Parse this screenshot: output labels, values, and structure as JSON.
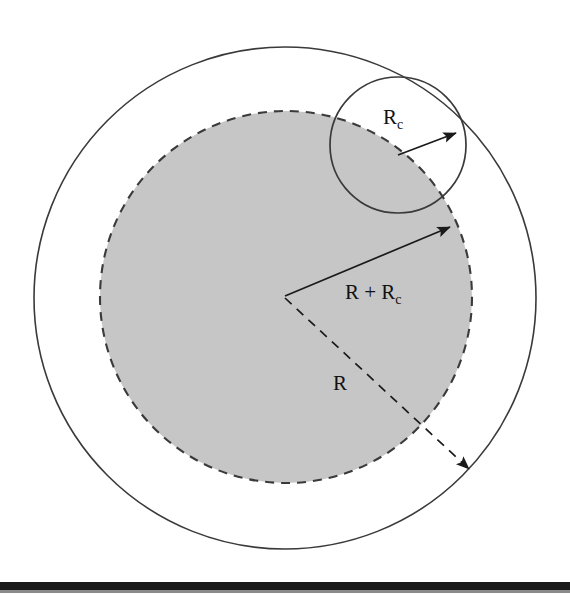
{
  "figure": {
    "background_color": "#ffffff",
    "stroke_color": "#3a3a3a",
    "shade_color": "#c6c6c6",
    "label_color": "#111111",
    "baseline_bar_color": "#1a1a1a"
  },
  "labels": {
    "small_radius": {
      "base": "R",
      "sub": "c"
    },
    "sum_radius": {
      "base": "R + R",
      "sub": "c"
    },
    "big_radius": {
      "base": "R",
      "sub": ""
    }
  },
  "geometry": {
    "center": {
      "x": 285,
      "y": 298
    },
    "outer_circle": {
      "cx": 285,
      "cy": 298,
      "r": 251,
      "style": "solid",
      "fill": "none"
    },
    "shaded_circle": {
      "cx": 286,
      "cy": 297,
      "r": 186,
      "style": "dashed",
      "fill": "#c6c6c6"
    },
    "probe_circle": {
      "cx": 398,
      "cy": 145,
      "r": 68,
      "style": "solid",
      "fill": "none"
    },
    "arrow_small_radius": {
      "x1": 398,
      "y1": 155,
      "x2": 458,
      "y2": 132,
      "style": "solid"
    },
    "arrow_sum_radius": {
      "x1": 285,
      "y1": 296,
      "x2": 452,
      "y2": 226,
      "style": "solid"
    },
    "arrow_big_radius": {
      "x1": 285,
      "y1": 298,
      "x2": 472,
      "y2": 472,
      "style": "dashed"
    },
    "baseline_bar": {
      "x": 0,
      "y": 582,
      "width": 570,
      "height": 8
    }
  },
  "label_positions": {
    "small_radius": {
      "x": 383,
      "y": 124
    },
    "sum_radius": {
      "x": 345,
      "y": 299
    },
    "big_radius": {
      "x": 333,
      "y": 390
    }
  }
}
